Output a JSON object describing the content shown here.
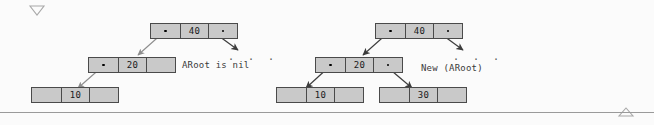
{
  "page": {
    "width": 654,
    "height": 125,
    "background": "#fbfbfb",
    "node_fill": "#c9c9c9",
    "node_border": "#4a4a4a",
    "arrow_color": "#3c3c3c",
    "text_color": "#3a3a3a"
  },
  "markers": {
    "top_caret": "triangle-down",
    "bottom_caret": "triangle-up"
  },
  "diagrams": [
    {
      "id": "before",
      "caption": "ARoot is nil",
      "ellipsis": ". . .",
      "nodes": [
        {
          "name": "node-40",
          "key": "40",
          "left": "pointer",
          "right": "pointer"
        },
        {
          "name": "node-20",
          "key": "20",
          "left": "pointer",
          "right": "nil"
        },
        {
          "name": "node-10",
          "key": "10",
          "left": "nil",
          "right": "nil"
        }
      ]
    },
    {
      "id": "after",
      "caption": "New (ARoot)",
      "ellipsis": ". . .",
      "nodes": [
        {
          "name": "node-40",
          "key": "40",
          "left": "pointer",
          "right": "pointer"
        },
        {
          "name": "node-20",
          "key": "20",
          "left": "pointer",
          "right": "pointer"
        },
        {
          "name": "node-10",
          "key": "10",
          "left": "nil",
          "right": "nil"
        },
        {
          "name": "node-30",
          "key": "30",
          "left": "nil",
          "right": "nil"
        }
      ]
    }
  ]
}
